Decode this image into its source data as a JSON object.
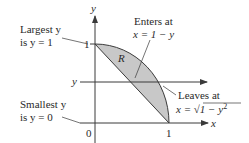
{
  "diagram": {
    "axes": {
      "x_label": "x",
      "y_label": "y",
      "tick_x_one": "1",
      "tick_y_one": "1",
      "origin": "0"
    },
    "region_label": "R",
    "slice_label": "y",
    "annotations": {
      "largest_line1": "Largest y",
      "largest_line2": "is y = 1",
      "smallest_line1": "Smallest y",
      "smallest_line2": "is y = 0",
      "enters_line1": "Enters at",
      "enters_line2": "x = 1 − y",
      "leaves_line1": "Leaves at",
      "leaves_line2_prefix": "x = ",
      "leaves_line2_radicand": "1 − y",
      "leaves_line2_exp": "2"
    },
    "colors": {
      "region_fill": "#c8c8c8",
      "axis": "#3a3a3a",
      "text": "#2a2a2a",
      "background": "#ffffff"
    }
  }
}
